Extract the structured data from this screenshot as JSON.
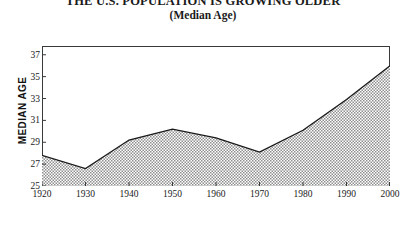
{
  "chart_data": {
    "type": "area",
    "title": "THE U.S. POPULATION IS GROWING OLDER",
    "subtitle": "(Median Age)",
    "xlabel": "",
    "ylabel": "MEDIAN AGE",
    "categories": [
      "1920",
      "1930",
      "1940",
      "1950",
      "1960",
      "1970",
      "1980",
      "1990",
      "2000"
    ],
    "x": [
      1920,
      1930,
      1940,
      1950,
      1960,
      1970,
      1980,
      1990,
      2000
    ],
    "values": [
      27.8,
      26.6,
      29.2,
      30.2,
      29.4,
      28.1,
      30.1,
      32.9,
      36.0
    ],
    "series": [
      {
        "name": "Median Age",
        "values": [
          27.8,
          26.6,
          29.2,
          30.2,
          29.4,
          28.1,
          30.1,
          32.9,
          36.0
        ]
      }
    ],
    "ylim": [
      25,
      37.8
    ],
    "xlim": [
      1920,
      2000
    ],
    "ytick_labels": [
      "25",
      "27",
      "29",
      "31",
      "33",
      "35",
      "37"
    ],
    "ytick_values": [
      25,
      27,
      29,
      31,
      33,
      35,
      37
    ],
    "xtick_labels": [
      "1920",
      "1930",
      "1940",
      "1950",
      "1960",
      "1970",
      "1980",
      "1990",
      "2000"
    ],
    "xtick_values": [
      1920,
      1930,
      1940,
      1950,
      1960,
      1970,
      1980,
      1990,
      2000
    ],
    "grid": false,
    "legend": "none",
    "line_color": "#1a1a1a",
    "fill_pattern": "stipple-halftone",
    "fill_color": "#9a9a9a",
    "frame_color": "#3a3a3a",
    "background": "#ffffff"
  }
}
